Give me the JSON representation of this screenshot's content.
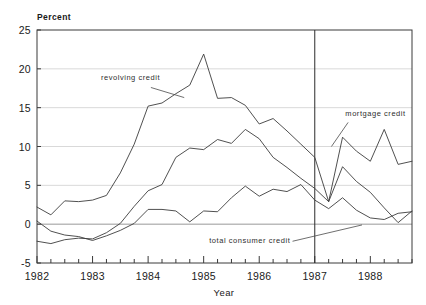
{
  "chart_data": {
    "type": "line",
    "title": "",
    "xlabel": "Year",
    "ylabel": "Percent",
    "xlim": [
      1982.0,
      1988.75
    ],
    "ylim": [
      -5,
      25
    ],
    "yticks": [
      -5,
      0,
      5,
      10,
      15,
      20,
      25
    ],
    "ytick_labels": [
      "-5",
      "0",
      "5",
      "10",
      "15",
      "20",
      "25"
    ],
    "xticks": [
      1982,
      1983,
      1984,
      1985,
      1986,
      1987,
      1988
    ],
    "xtick_labels": [
      "1982",
      "1983",
      "1984",
      "1985",
      "1986",
      "1987",
      "1988"
    ],
    "x_minor_step": 0.25,
    "grid": "horizontal",
    "legend": "inline-annotations",
    "x": [
      1982.0,
      1982.25,
      1982.5,
      1982.75,
      1983.0,
      1983.25,
      1983.5,
      1983.75,
      1984.0,
      1984.25,
      1984.5,
      1984.75,
      1985.0,
      1985.25,
      1985.5,
      1985.75,
      1986.0,
      1986.25,
      1986.5,
      1986.75,
      1987.0,
      1987.25,
      1987.5,
      1987.75,
      1988.0,
      1988.25,
      1988.5,
      1988.75
    ],
    "series": [
      {
        "name": "revolving credit",
        "values": [
          2.2,
          1.2,
          3.0,
          2.9,
          3.1,
          3.7,
          6.6,
          10.3,
          15.2,
          15.6,
          16.8,
          17.9,
          21.9,
          16.2,
          16.3,
          15.3,
          12.9,
          13.6,
          12.0,
          10.3,
          8.6,
          2.9,
          7.4,
          5.5,
          4.1,
          2.1,
          0.2,
          1.7
        ]
      },
      {
        "name": "mortgage credit",
        "values": [
          -2.2,
          -2.5,
          -2.0,
          -1.8,
          -1.9,
          -1.1,
          0.1,
          2.3,
          4.3,
          5.1,
          8.6,
          9.8,
          9.6,
          10.9,
          10.4,
          12.2,
          11.0,
          8.6,
          7.3,
          5.9,
          4.6,
          2.9,
          11.2,
          9.4,
          8.1,
          12.2,
          7.7,
          8.1
        ]
      },
      {
        "name": "total consumer credit",
        "values": [
          0.4,
          -0.9,
          -1.4,
          -1.6,
          -2.1,
          -1.5,
          -0.8,
          0.1,
          1.9,
          1.9,
          1.7,
          0.3,
          1.7,
          1.6,
          3.4,
          4.9,
          3.6,
          4.5,
          4.2,
          5.1,
          3.1,
          2.0,
          3.4,
          1.8,
          0.8,
          0.6,
          1.4,
          1.6
        ]
      },
      {
        "name": "fourth series",
        "values": [
          null,
          null,
          null,
          null,
          null,
          null,
          null,
          null,
          null,
          null,
          null,
          null,
          null,
          null,
          null,
          null,
          null,
          null,
          null,
          null,
          null,
          null,
          null,
          null,
          null,
          null,
          null,
          null
        ]
      }
    ],
    "event_line": {
      "x": 1987.0,
      "label": ""
    },
    "annotations": [
      {
        "name": "revolving credit",
        "text": "revolving credit",
        "x": 1983.15,
        "y": 18.6,
        "anchor": "start",
        "leader": [
          [
            1984.05,
            17.6
          ],
          [
            1984.65,
            16.3
          ]
        ]
      },
      {
        "name": "mortgage credit",
        "text": "mortgage credit",
        "x": 1987.55,
        "y": 13.9,
        "anchor": "start",
        "leader": [
          [
            1987.6,
            13.1
          ],
          [
            1987.3,
            10.0
          ]
        ]
      },
      {
        "name": "total consumer credit",
        "text": "total consumer credit",
        "x": 1985.1,
        "y": -2.45,
        "anchor": "start",
        "leader": [
          [
            1986.6,
            -2.2
          ],
          [
            1987.85,
            -0.1
          ]
        ]
      }
    ]
  }
}
